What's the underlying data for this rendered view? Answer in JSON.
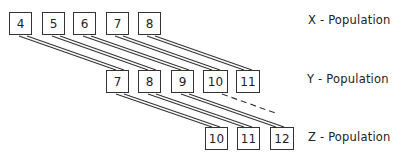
{
  "diagram": {
    "colors": {
      "stroke": "#333333",
      "text": "#222222",
      "background": "#ffffff"
    },
    "rows": [
      {
        "name": "x-population",
        "label": "X - Population",
        "values": [
          "4",
          "5",
          "6",
          "7",
          "8"
        ]
      },
      {
        "name": "y-population",
        "label": "Y - Population",
        "values": [
          "7",
          "8",
          "9",
          "10",
          "11"
        ]
      },
      {
        "name": "z-population",
        "label": "Z - Population",
        "values": [
          "10",
          "11",
          "12"
        ]
      }
    ],
    "connections": [
      {
        "from": "X:4",
        "to": "Y:7",
        "style": "double-solid"
      },
      {
        "from": "X:5",
        "to": "Y:8",
        "style": "double-solid"
      },
      {
        "from": "X:6",
        "to": "Y:9",
        "style": "double-solid"
      },
      {
        "from": "X:7",
        "to": "Y:10",
        "style": "double-solid"
      },
      {
        "from": "X:8",
        "to": "Y:11",
        "style": "double-solid"
      },
      {
        "from": "Y:7",
        "to": "Z:10",
        "style": "double-solid"
      },
      {
        "from": "Y:8",
        "to": "Z:11",
        "style": "double-solid"
      },
      {
        "from": "Y:9",
        "to": "Z:12",
        "style": "double-solid"
      },
      {
        "from": "Y:10",
        "to": "beyond",
        "style": "dashed"
      }
    ]
  }
}
